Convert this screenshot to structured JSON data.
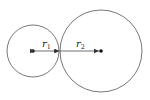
{
  "diagram": {
    "type": "tangent-circles",
    "colors": {
      "stroke": "#555555",
      "text": "#222222",
      "background": "#ffffff"
    },
    "circles": [
      {
        "name": "small-circle",
        "cx": 33,
        "cy": 51,
        "r": 26
      },
      {
        "name": "large-circle",
        "cx": 101,
        "cy": 51,
        "r": 41
      }
    ],
    "tangent_point": {
      "x": 59,
      "y": 51
    },
    "labels": {
      "r1": {
        "symbol": "r",
        "subscript": "1"
      },
      "r2": {
        "symbol": "r",
        "subscript": "2"
      }
    }
  }
}
